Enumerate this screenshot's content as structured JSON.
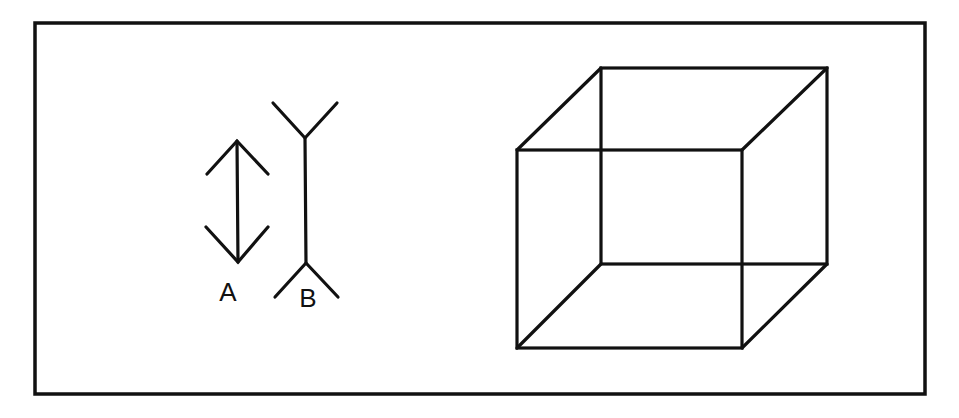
{
  "figure": {
    "stroke_color": "#111111",
    "background": "#ffffff",
    "frame": {
      "x": 35,
      "y": 23,
      "width": 890,
      "height": 371
    }
  },
  "muller_lyer": {
    "line_a": {
      "label": "A",
      "label_pos": [
        228,
        301
      ],
      "shaft": [
        [
          237,
          141
        ],
        [
          238,
          262
        ]
      ],
      "top_arrowhead": {
        "apex": [
          237,
          141
        ],
        "left": [
          207,
          174
        ],
        "right": [
          268,
          174
        ]
      },
      "bottom_arrowhead": {
        "apex": [
          238,
          262
        ],
        "left": [
          206,
          227
        ],
        "right": [
          268,
          227
        ]
      }
    },
    "line_b": {
      "label": "B",
      "label_pos": [
        308,
        307
      ],
      "shaft": [
        [
          305,
          138
        ],
        [
          306,
          263
        ]
      ],
      "top_fins": {
        "vertex": [
          305,
          138
        ],
        "left": [
          273,
          103
        ],
        "right": [
          337,
          103
        ]
      },
      "bottom_fins": {
        "vertex": [
          306,
          263
        ],
        "left": [
          275,
          297
        ],
        "right": [
          338,
          297
        ]
      }
    }
  },
  "necker_cube": {
    "front_face": {
      "tl": [
        517,
        150
      ],
      "tr": [
        742,
        150
      ],
      "br": [
        742,
        348
      ],
      "bl": [
        517,
        348
      ]
    },
    "back_face": {
      "tl": [
        601,
        68
      ],
      "tr": [
        827,
        68
      ],
      "br": [
        827,
        264
      ],
      "bl": [
        602,
        264
      ]
    }
  }
}
